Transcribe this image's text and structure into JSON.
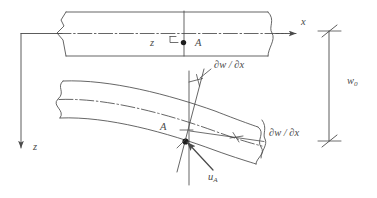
{
  "figure": {
    "stroke_color": "#4a4a4a",
    "fill_color": "#ffffff",
    "background": "#ffffff"
  },
  "labels": {
    "x_axis": "x",
    "z_axis_global": "z",
    "z_offset": "z",
    "point_a_top": "A",
    "point_a_bottom": "A",
    "slope_upper": "∂w / ∂x",
    "slope_lower": "∂w / ∂x",
    "axial_displacement": "u",
    "axial_displacement_sub": "A",
    "deflection": "w",
    "deflection_sub": "0"
  },
  "annotations": {
    "top_beam": "undeformed-beam",
    "bottom_beam": "deformed-beam",
    "centroidal_axis": "dash-dot-centerline",
    "cross_section_line": "vertical-section-line",
    "normal_line": "rotated-normal-line",
    "dimension_line": "w0-dimension-line",
    "break_symbol": "s-curve-break"
  }
}
